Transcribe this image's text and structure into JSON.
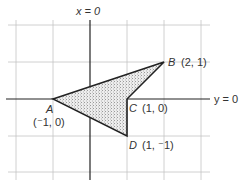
{
  "diagram": {
    "type": "coordinate-geometry",
    "axes": {
      "vertical_label": "x = 0",
      "horizontal_label": "y = 0"
    },
    "grid": {
      "unit_px": 37,
      "origin_px": [
        90,
        99
      ]
    },
    "shape": {
      "fill": "#e8e8e8",
      "stroke": "#222222",
      "vertices_order": [
        "A",
        "B",
        "C",
        "D"
      ]
    },
    "points": [
      {
        "name": "A",
        "coords": "(⁻1, 0)",
        "x": -1,
        "y": 0
      },
      {
        "name": "B",
        "coords": "(2, 1)",
        "x": 2,
        "y": 1
      },
      {
        "name": "C",
        "coords": "(1, 0)",
        "x": 1,
        "y": 0
      },
      {
        "name": "D",
        "coords": "(1, ⁻1)",
        "x": 1,
        "y": -1
      }
    ]
  },
  "labels": {
    "x_eq_0": "x = 0",
    "y_eq_0": "y = 0",
    "A_name": "A",
    "A_coords": "(⁻1, 0)",
    "B_name": "B",
    "B_coords": "(2, 1)",
    "C_name": "C",
    "C_coords": "(1, 0)",
    "D_name": "D",
    "D_coords": "(1, ⁻1)"
  }
}
